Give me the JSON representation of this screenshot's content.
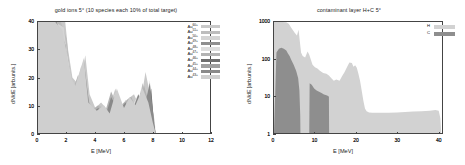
{
  "figure": {
    "background": "#ffffff",
    "axis_color": "#444444"
  },
  "panels": [
    {
      "id": "gold-ions",
      "title": "gold ions 5° (10 species each 10% of total target)",
      "xlabel": "E [MeV]",
      "ylabel": "dN/dE [arb.units.]",
      "xticks": [
        "0",
        "2",
        "4",
        "6",
        "8",
        "10",
        "12"
      ],
      "yticks": [
        "0",
        "10",
        "20",
        "30",
        "40"
      ],
      "legend": [
        {
          "label": "Au",
          "charge": "60+",
          "color": "#c9c9c9"
        },
        {
          "label": "Au",
          "charge": "51+",
          "color": "#bdbdbd"
        },
        {
          "label": "Au",
          "charge": "50+",
          "color": "#d4d4d4"
        },
        {
          "label": "Au",
          "charge": "49+",
          "color": "#8f8f8f"
        },
        {
          "label": "Au",
          "charge": "48+",
          "color": "#dedede"
        },
        {
          "label": "Au",
          "charge": "47+",
          "color": "#b3b3b3"
        },
        {
          "label": "Au",
          "charge": "46+",
          "color": "#6e6e6e"
        },
        {
          "label": "Au",
          "charge": "45+",
          "color": "#a0a0a0"
        },
        {
          "label": "Au",
          "charge": "44+",
          "color": "#8a8a8a"
        },
        {
          "label": "Au",
          "charge": "43+",
          "color": "#cfcfcf"
        }
      ]
    },
    {
      "id": "contaminant-layer",
      "title": "contaminant layer H+C 5°",
      "xlabel": "E [MeV]",
      "ylabel": "dN/dE [arb.units.]",
      "xticks": [
        "0",
        "10",
        "20",
        "30",
        "40"
      ],
      "yticks": [
        "1",
        "10",
        "100",
        "1000"
      ],
      "legend": [
        {
          "label": "H",
          "color": "#d2d2d2"
        },
        {
          "label": "C",
          "color": "#8e8e8e"
        }
      ]
    }
  ],
  "chart_data": [
    {
      "type": "area",
      "id": "gold-ions",
      "title": "gold ions 5° (10 species each 10% of total target)",
      "xlabel": "E [MeV]",
      "ylabel": "dN/dE [arb.units.]",
      "xlim": [
        0,
        12
      ],
      "ylim": [
        0,
        40
      ],
      "xticks": [
        0,
        2,
        4,
        6,
        8,
        10,
        12
      ],
      "yticks": [
        0,
        10,
        20,
        30,
        40
      ],
      "yscale": "linear",
      "grid": false,
      "legend_position": "top-right",
      "note": "Ten overlapping filled gold charge-state spectra; signal ends near 8.2 MeV",
      "series": [
        {
          "name": "Au60+",
          "color": "#c9c9c9",
          "x": [
            0,
            0.4,
            0.9,
            1.4,
            1.9,
            2.1,
            2.4,
            2.9,
            3.3,
            3.6,
            4.0,
            4.4,
            4.9,
            5.4,
            5.8,
            6.2,
            6.7,
            7.1,
            7.5,
            7.9,
            8.15,
            8.2
          ],
          "values": [
            40,
            40,
            40,
            40,
            40,
            30,
            20,
            17,
            28,
            14,
            9,
            11,
            8,
            16,
            7,
            12,
            14,
            9,
            22,
            12,
            4,
            0
          ]
        },
        {
          "name": "Au51+",
          "color": "#bdbdbd",
          "x": [
            0,
            0.5,
            1.0,
            1.6,
            2.0,
            2.3,
            2.7,
            3.1,
            3.5,
            3.9,
            4.3,
            4.8,
            5.2,
            5.6,
            6.0,
            6.5,
            6.9,
            7.3,
            7.7,
            8.0,
            8.2
          ],
          "values": [
            40,
            40,
            40,
            40,
            34,
            18,
            15,
            22,
            12,
            8,
            10,
            7,
            13,
            6,
            11,
            13,
            8,
            18,
            10,
            3,
            0
          ]
        },
        {
          "name": "Au50+",
          "color": "#d4d4d4",
          "x": [
            0,
            0.6,
            1.2,
            1.8,
            2.2,
            2.6,
            3.0,
            3.4,
            3.8,
            4.2,
            4.7,
            5.1,
            5.5,
            5.9,
            6.4,
            6.8,
            7.2,
            7.6,
            8.0,
            8.2
          ],
          "values": [
            40,
            40,
            40,
            38,
            22,
            14,
            24,
            10,
            7,
            9,
            6,
            12,
            15,
            9,
            11,
            7,
            16,
            9,
            3,
            0
          ]
        },
        {
          "name": "Au49+",
          "color": "#8f8f8f",
          "x": [
            0,
            0.7,
            1.3,
            1.9,
            2.3,
            2.8,
            3.2,
            3.6,
            4.1,
            4.5,
            5.0,
            5.4,
            5.9,
            6.3,
            6.8,
            7.2,
            7.6,
            8.0,
            8.2
          ],
          "values": [
            40,
            40,
            40,
            32,
            16,
            12,
            26,
            9,
            6,
            8,
            5,
            14,
            8,
            10,
            6,
            15,
            8,
            2,
            0
          ]
        },
        {
          "name": "Au48+",
          "color": "#dedede",
          "x": [
            0,
            0.5,
            1.1,
            1.7,
            2.1,
            2.5,
            2.9,
            3.4,
            3.9,
            4.4,
            4.9,
            5.3,
            5.7,
            6.1,
            6.6,
            7.0,
            7.4,
            7.8,
            8.1,
            8.2
          ],
          "values": [
            40,
            40,
            40,
            36,
            26,
            13,
            19,
            11,
            7,
            9,
            6,
            13,
            7,
            12,
            10,
            14,
            7,
            19,
            4,
            0
          ]
        },
        {
          "name": "Au47+",
          "color": "#b3b3b3",
          "x": [
            0,
            0.6,
            1.2,
            1.8,
            2.4,
            2.8,
            3.3,
            3.7,
            4.2,
            4.6,
            5.1,
            5.6,
            6.0,
            6.5,
            6.9,
            7.4,
            7.8,
            8.1,
            8.2
          ],
          "values": [
            40,
            40,
            40,
            30,
            15,
            21,
            11,
            8,
            10,
            6,
            15,
            9,
            11,
            13,
            8,
            17,
            10,
            3,
            0
          ]
        },
        {
          "name": "Au46+",
          "color": "#6e6e6e",
          "x": [
            0,
            0.8,
            1.4,
            2.0,
            2.5,
            3.0,
            3.4,
            3.8,
            4.3,
            4.8,
            5.2,
            5.7,
            6.2,
            6.6,
            7.0,
            7.5,
            7.9,
            8.1,
            8.2
          ],
          "values": [
            40,
            40,
            38,
            24,
            12,
            23,
            9,
            6,
            8,
            5,
            12,
            7,
            10,
            6,
            13,
            8,
            16,
            3,
            0
          ]
        },
        {
          "name": "Au45+",
          "color": "#a0a0a0",
          "x": [
            0,
            0.5,
            1.1,
            1.6,
            2.2,
            2.7,
            3.1,
            3.6,
            4.0,
            4.5,
            5.0,
            5.5,
            5.9,
            6.4,
            6.9,
            7.3,
            7.7,
            8.0,
            8.2
          ],
          "values": [
            40,
            40,
            40,
            34,
            18,
            16,
            25,
            10,
            7,
            9,
            6,
            14,
            8,
            12,
            9,
            15,
            9,
            3,
            0
          ]
        },
        {
          "name": "Au44+",
          "color": "#8a8a8a",
          "x": [
            0,
            0.7,
            1.3,
            1.9,
            2.4,
            2.9,
            3.3,
            3.7,
            4.2,
            4.7,
            5.1,
            5.6,
            6.1,
            6.5,
            7.0,
            7.4,
            7.8,
            8.1,
            8.2
          ],
          "values": [
            40,
            40,
            39,
            28,
            14,
            20,
            10,
            7,
            9,
            6,
            13,
            8,
            11,
            7,
            14,
            9,
            18,
            4,
            0
          ]
        },
        {
          "name": "Au43+",
          "color": "#cfcfcf",
          "x": [
            0,
            0.6,
            1.2,
            1.7,
            2.3,
            2.6,
            3.2,
            3.5,
            4.1,
            4.6,
            5.0,
            5.5,
            6.0,
            6.4,
            6.8,
            7.3,
            7.7,
            8.0,
            8.2
          ],
          "values": [
            40,
            40,
            40,
            37,
            20,
            17,
            27,
            11,
            8,
            10,
            7,
            16,
            9,
            13,
            10,
            16,
            11,
            4,
            0
          ]
        }
      ]
    },
    {
      "type": "area",
      "id": "contaminant-layer",
      "title": "contaminant layer H+C 5°",
      "xlabel": "E [MeV]",
      "ylabel": "dN/dE [arb.units.]",
      "xlim": [
        0,
        41
      ],
      "ylim": [
        1,
        1000
      ],
      "xticks": [
        0,
        10,
        20,
        30,
        40
      ],
      "yticks": [
        1,
        10,
        100,
        1000
      ],
      "yscale": "log",
      "grid": false,
      "legend_position": "top-right",
      "series": [
        {
          "name": "H",
          "color": "#d2d2d2",
          "x": [
            0,
            1,
            2,
            3,
            3.6,
            4.2,
            5,
            5.6,
            6.0,
            6.3,
            6.6,
            7.0,
            7.6,
            8.2,
            8.6,
            9.0,
            9.4,
            10.0,
            10.6,
            11.2,
            12.0,
            12.8,
            13.4,
            14.0,
            14.6,
            15.2,
            16.0,
            16.6,
            17.2,
            17.8,
            18.4,
            19.0,
            19.4,
            19.8,
            20.2,
            20.6,
            21.0,
            21.4,
            21.8,
            22.2,
            22.6,
            23.2,
            24,
            26,
            28,
            30,
            32,
            34,
            36,
            38,
            39.4,
            40.2,
            40.6,
            40.8
          ],
          "values": [
            1000,
            1000,
            1000,
            980,
            900,
            700,
            520,
            430,
            620,
            300,
            150,
            120,
            110,
            160,
            130,
            95,
            70,
            60,
            55,
            48,
            42,
            40,
            36,
            30,
            26,
            28,
            26,
            34,
            44,
            60,
            80,
            78,
            62,
            68,
            58,
            40,
            26,
            14,
            7.5,
            4.6,
            3.9,
            3.6,
            3.5,
            3.5,
            3.5,
            3.6,
            3.7,
            3.8,
            3.9,
            4.0,
            4.2,
            4.0,
            2.5,
            1
          ]
        },
        {
          "name": "C",
          "color": "#8e8e8e",
          "x": [
            0,
            0.6,
            1.2,
            1.8,
            2.4,
            3.0,
            3.4,
            3.8,
            4.2,
            4.8,
            5.4,
            5.9,
            6.2,
            6.4,
            6.45,
            8.6,
            8.7,
            9.2,
            9.8,
            10.4,
            11.0,
            11.6,
            12.2,
            12.8,
            13.2,
            13.4,
            13.45
          ],
          "values": [
            1,
            150,
            190,
            200,
            190,
            170,
            140,
            120,
            95,
            70,
            48,
            30,
            14,
            3,
            1,
            1,
            22,
            20,
            16,
            14,
            13,
            12,
            11,
            10.5,
            10,
            9.5,
            1
          ]
        }
      ]
    }
  ]
}
